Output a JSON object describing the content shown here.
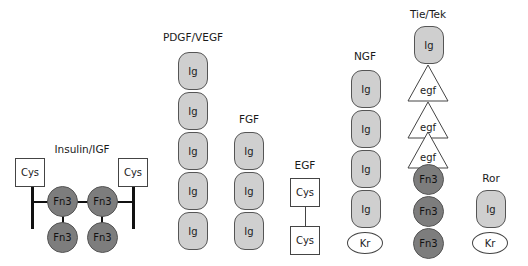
{
  "families": [
    {
      "name": "Insulin/IGF",
      "domains": [
        "Cys",
        "Fn3",
        "Fn3",
        "Cys",
        "Fn3",
        "Fn3"
      ]
    },
    {
      "name": "PDGF/VEGF",
      "domains": [
        "Ig",
        "Ig",
        "Ig",
        "Ig",
        "Ig"
      ]
    },
    {
      "name": "FGF",
      "domains": [
        "Ig",
        "Ig",
        "Ig"
      ]
    },
    {
      "name": "EGF",
      "domains": [
        "Cys",
        "Cys"
      ]
    },
    {
      "name": "NGF",
      "domains": [
        "Ig",
        "Ig",
        "Ig",
        "Ig",
        "Kr"
      ]
    },
    {
      "name": "Tie/Tek",
      "domains": [
        "Ig",
        "egf",
        "egf",
        "egf",
        "Fn3",
        "Fn3",
        "Fn3"
      ]
    },
    {
      "name": "Ror",
      "domains": [
        "Ig",
        "Kr"
      ]
    }
  ],
  "domain_labels": {
    "ig": "Ig",
    "fn3": "Fn3",
    "cys": "Cys",
    "kr": "Kr",
    "egf": "egf"
  },
  "colors": {
    "ig_fill": "#cfcfcf",
    "fn3_fill": "#7d7d7d",
    "cys_fill": "#ffffff",
    "kr_fill": "#ffffff"
  }
}
